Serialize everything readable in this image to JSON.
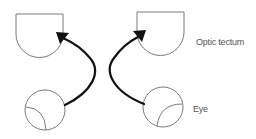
{
  "diagram": {
    "labels": {
      "optic_tectum": "Optic tectum",
      "eye": "Eye"
    },
    "colors": {
      "outline": "#7a7a7a",
      "arrow": "#111111",
      "label_text": "#555555",
      "background": "#ffffff"
    },
    "nodes": [
      {
        "id": "left-tectum",
        "type": "optic-tectum"
      },
      {
        "id": "right-tectum",
        "type": "optic-tectum"
      },
      {
        "id": "left-eye",
        "type": "eye"
      },
      {
        "id": "right-eye",
        "type": "eye"
      }
    ],
    "edges": [
      {
        "from": "left-eye",
        "to": "left-tectum",
        "style": "curved-arrow"
      },
      {
        "from": "right-eye",
        "to": "right-tectum",
        "style": "curved-arrow"
      }
    ]
  }
}
